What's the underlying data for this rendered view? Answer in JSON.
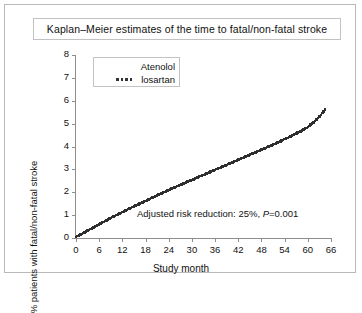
{
  "figure": {
    "title": "Kaplan–Meier estimates of the time to fatal/non-fatal stroke",
    "xlabel": "Study month",
    "ylabel": "% patients with fatal/non-fatal stroke",
    "annotation_prefix": "Adjusted risk reduction: 25%, ",
    "annotation_italic": "P",
    "annotation_suffix": "=0.001"
  },
  "legend": {
    "entries": [
      {
        "label": "Atenolol",
        "style": "solid"
      },
      {
        "label": "losartan",
        "style": "dotted"
      }
    ]
  },
  "chart_data": {
    "type": "line",
    "title": "Kaplan–Meier estimates of the time to fatal/non-fatal stroke",
    "xlabel": "Study month",
    "ylabel": "% patients with fatal/non-fatal stroke",
    "xlim": [
      0,
      66
    ],
    "ylim": [
      0,
      8
    ],
    "xticks": [
      0,
      6,
      12,
      18,
      24,
      30,
      36,
      42,
      48,
      54,
      60,
      66
    ],
    "yticks": [
      0,
      1,
      2,
      3,
      4,
      5,
      6,
      7,
      8
    ],
    "grid": false,
    "legend_position": "upper-left",
    "annotation": "Adjusted risk reduction: 25%, P=0.001",
    "series": [
      {
        "name": "losartan",
        "style": "dotted",
        "color": "#2e2e2e",
        "x": [
          0,
          1.5,
          3,
          4.5,
          6,
          7.5,
          9,
          10.5,
          12,
          13.5,
          15,
          16.5,
          18,
          19.5,
          21,
          22.5,
          24,
          25.5,
          27,
          28.5,
          30,
          31.5,
          33,
          34.5,
          36,
          37.5,
          39,
          40.5,
          42,
          43.5,
          45,
          46.5,
          48,
          49.5,
          51,
          52.5,
          54,
          55.5,
          57,
          58.5,
          60,
          61.5,
          63,
          64.5
        ],
        "values": [
          0.05,
          0.18,
          0.32,
          0.46,
          0.6,
          0.74,
          0.88,
          1.0,
          1.13,
          1.26,
          1.38,
          1.5,
          1.62,
          1.74,
          1.86,
          1.98,
          2.1,
          2.21,
          2.32,
          2.43,
          2.54,
          2.65,
          2.76,
          2.87,
          2.98,
          3.09,
          3.2,
          3.31,
          3.42,
          3.53,
          3.64,
          3.75,
          3.86,
          3.97,
          4.08,
          4.2,
          4.32,
          4.44,
          4.57,
          4.7,
          4.85,
          5.05,
          5.3,
          5.62
        ]
      },
      {
        "name": "Atenolol",
        "style": "solid",
        "color": "#ffffff",
        "x": [],
        "values": []
      }
    ]
  }
}
